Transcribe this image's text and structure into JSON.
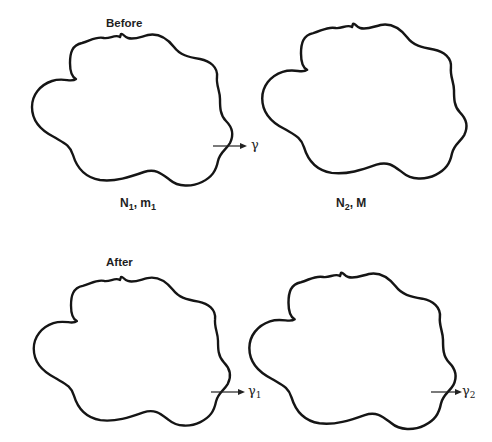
{
  "diagram": {
    "type": "before-after system diagram",
    "rows": [
      {
        "label": "Before",
        "systems": [
          {
            "id": "sys1_before",
            "caption_main": "N",
            "caption_sub": "1",
            "caption_sep": ", ",
            "caption_main2": "m",
            "caption_sub2": "1",
            "arrow_label": "γ",
            "arrow_sub": ""
          },
          {
            "id": "sys2_before",
            "caption_main": "N",
            "caption_sub": "2",
            "caption_sep": ", ",
            "caption_main2": "M",
            "caption_sub2": ""
          }
        ]
      },
      {
        "label": "After",
        "systems": [
          {
            "id": "sys1_after",
            "arrow_label": "γ",
            "arrow_sub": "1"
          },
          {
            "id": "sys2_after",
            "arrow_label": "γ",
            "arrow_sub": "2"
          }
        ]
      }
    ],
    "colors": {
      "stroke": "#151515",
      "background": "#ffffff"
    }
  }
}
